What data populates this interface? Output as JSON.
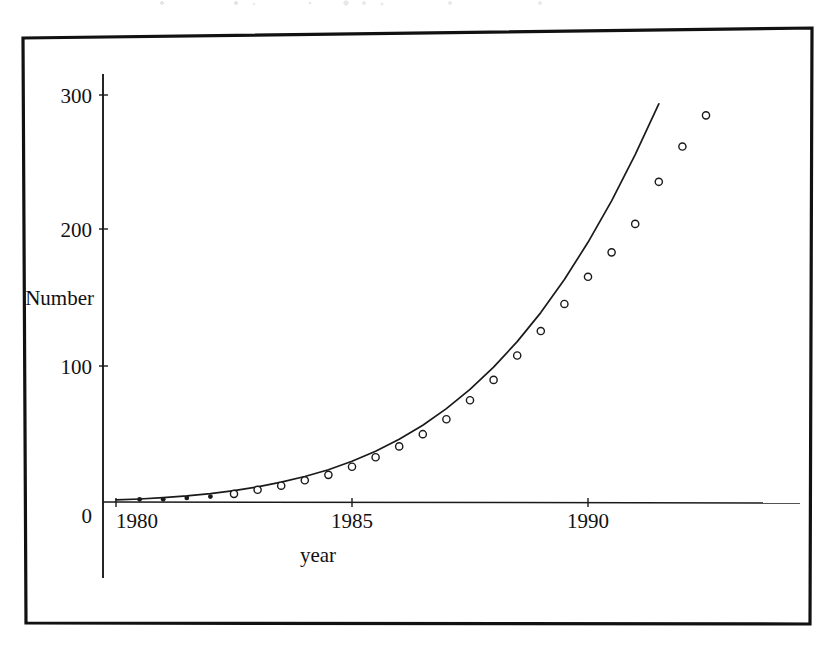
{
  "figure": {
    "frame_color": "#111111",
    "ink_color": "#1a1a1a",
    "background": "#ffffff"
  },
  "chart_data": {
    "type": "scatter",
    "title": "",
    "subtitle": "",
    "xlabel": "year",
    "ylabel": "Number",
    "xlim": [
      1979.5,
      1993.0
    ],
    "ylim": [
      0,
      310
    ],
    "xticks": [
      1980,
      1985,
      1990
    ],
    "xticklabels": [
      "1980",
      "1985",
      "1990"
    ],
    "yticks": [
      0,
      100,
      200,
      300
    ],
    "yticklabels": [
      "0",
      "100",
      "200",
      "300"
    ],
    "grid": false,
    "legend": null,
    "annotations": [],
    "series": [
      {
        "name": "observed",
        "marker": "circle",
        "marker_style": "filled-then-open",
        "x": [
          1980.5,
          1981.0,
          1981.5,
          1982.0,
          1982.5,
          1983.0,
          1983.5,
          1984.0,
          1984.5,
          1985.0,
          1985.5,
          1986.0,
          1986.5,
          1987.0,
          1987.5,
          1988.0,
          1988.5,
          1989.0,
          1989.5,
          1990.0,
          1990.5,
          1991.0,
          1991.5,
          1992.0,
          1992.5
        ],
        "values": [
          2,
          2,
          3,
          4,
          6,
          9,
          12,
          16,
          20,
          26,
          33,
          41,
          50,
          61,
          75,
          90,
          108,
          126,
          146,
          166,
          184,
          205,
          236,
          262,
          285
        ]
      },
      {
        "name": "fitted exponential curve",
        "marker": "none",
        "line": "solid",
        "x": [
          1980.0,
          1980.5,
          1981.0,
          1981.5,
          1982.0,
          1982.5,
          1983.0,
          1983.5,
          1984.0,
          1984.5,
          1985.0,
          1985.5,
          1986.0,
          1986.5,
          1987.0,
          1987.5,
          1988.0,
          1988.5,
          1989.0,
          1989.5,
          1990.0,
          1990.5,
          1991.0,
          1991.5,
          1992.0,
          1992.5
        ],
        "values": [
          1.5,
          2.2,
          3.2,
          4.5,
          6.2,
          8.4,
          11.2,
          14.6,
          18.8,
          23.8,
          30.0,
          37.4,
          46.2,
          56.6,
          68.8,
          83.0,
          99.4,
          118.2,
          139.6,
          164.0,
          191.4,
          222.0,
          256.0,
          293.5,
          null,
          null
        ]
      }
    ]
  },
  "labels": {
    "y_axis_title": "Number",
    "x_axis_title": "year",
    "y_tick_300": "300",
    "y_tick_200": "200",
    "y_tick_100": "100",
    "y_tick_0": "0",
    "x_tick_1980": "1980",
    "x_tick_1985": "1985",
    "x_tick_1990": "1990"
  }
}
